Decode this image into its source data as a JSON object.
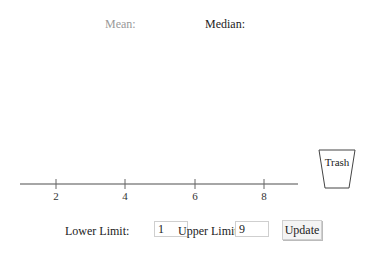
{
  "stats": {
    "mean_label": "Mean:",
    "median_label": "Median:"
  },
  "number_line": {
    "ticks": [
      {
        "value": 2,
        "label": "2"
      },
      {
        "value": 4,
        "label": "4"
      },
      {
        "value": 6,
        "label": "6"
      },
      {
        "value": 8,
        "label": "8"
      }
    ],
    "line_color": "#888888"
  },
  "trash": {
    "label": "Trash",
    "icon": "trash-bin-icon"
  },
  "controls": {
    "lower_label": "Lower Limit:",
    "lower_value": "1",
    "upper_label": "Upper Limit:",
    "upper_value": "9",
    "update_label": "Update"
  }
}
